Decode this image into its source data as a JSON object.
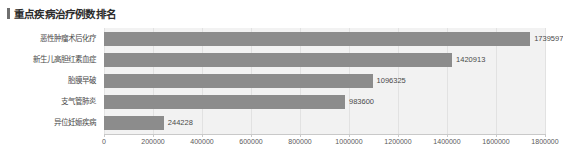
{
  "header": {
    "title": "重点疾病治疗例数排名",
    "accent_color": "#6f6f6f"
  },
  "chart_data": {
    "type": "bar",
    "orientation": "horizontal",
    "title": "重点疾病治疗例数排名",
    "xlabel": "",
    "ylabel": "",
    "categories": [
      "恶性肿瘤术后化疗",
      "新生儿高胆红素血症",
      "胎膜早破",
      "支气管肺炎",
      "异位妊娠疾病"
    ],
    "values": [
      1739597,
      1420913,
      1096325,
      983600,
      244228
    ],
    "value_labels": [
      "1739597",
      "1420913",
      "1096325",
      "983600",
      "244228"
    ],
    "xlim": [
      0,
      1800000
    ],
    "xticks": [
      0,
      200000,
      400000,
      600000,
      800000,
      1000000,
      1200000,
      1400000,
      1600000,
      1800000
    ],
    "xtick_labels": [
      "0",
      "200000",
      "400000",
      "600000",
      "800000",
      "1000000",
      "1200000",
      "1400000",
      "1600000",
      "1800000"
    ],
    "grid": true,
    "legend": null,
    "bar_color": "#8c8c8c",
    "plot_background": "#f2f2f2"
  }
}
